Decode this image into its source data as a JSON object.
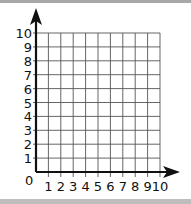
{
  "chart_data": {
    "type": "scatter",
    "title": "",
    "xlabel": "",
    "ylabel": "",
    "x_ticks": [
      "1",
      "2",
      "3",
      "4",
      "5",
      "6",
      "7",
      "8",
      "9",
      "10"
    ],
    "y_ticks": [
      "1",
      "2",
      "3",
      "4",
      "5",
      "6",
      "7",
      "8",
      "9",
      "10"
    ],
    "origin_label": "0",
    "xlim": [
      0,
      10
    ],
    "ylim": [
      0,
      10
    ],
    "grid": true,
    "series": [],
    "axis_arrows": true
  },
  "colors": {
    "axis": "#111111",
    "grid": "#555555",
    "background": "#ffffff"
  }
}
